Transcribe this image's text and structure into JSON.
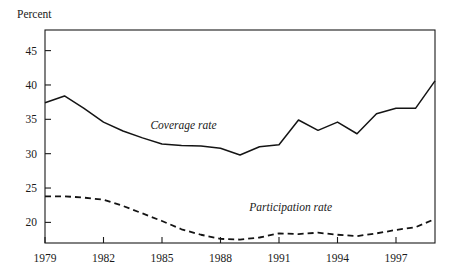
{
  "chart_data": {
    "type": "line",
    "title": "",
    "ylabel": "Percent",
    "xlabel": "",
    "grid": false,
    "legend_position": "inline-annotation",
    "xlim": [
      1979,
      1999
    ],
    "ylim": [
      17,
      48
    ],
    "x_ticks": [
      1979,
      1982,
      1985,
      1988,
      1991,
      1994,
      1997
    ],
    "x_tick_labels": [
      "1979",
      "1982",
      "1985",
      "1988",
      "1991",
      "1994",
      "1997"
    ],
    "y_ticks": [
      20,
      25,
      30,
      35,
      40,
      45
    ],
    "y_tick_labels": [
      "20",
      "25",
      "30",
      "35",
      "40",
      "45"
    ],
    "x": [
      1979,
      1980,
      1981,
      1982,
      1983,
      1984,
      1985,
      1986,
      1987,
      1988,
      1989,
      1990,
      1991,
      1992,
      1993,
      1994,
      1995,
      1996,
      1997,
      1998,
      1999
    ],
    "series": [
      {
        "name": "Coverage rate",
        "style": "solid",
        "color": "#141414",
        "label_x": 1986.1,
        "label_y": 33.6,
        "values": [
          37.4,
          38.4,
          36.6,
          34.6,
          33.3,
          32.3,
          31.4,
          31.2,
          31.1,
          30.8,
          29.8,
          31.0,
          31.3,
          34.9,
          33.4,
          34.6,
          32.9,
          35.8,
          36.6,
          36.6,
          40.6
        ]
      },
      {
        "name": "Participation rate",
        "style": "dashed",
        "color": "#141414",
        "label_x": 1991.6,
        "label_y": 21.7,
        "values": [
          23.8,
          23.8,
          23.6,
          23.3,
          22.4,
          21.3,
          20.2,
          19.0,
          18.2,
          17.6,
          17.5,
          17.8,
          18.4,
          18.3,
          18.5,
          18.2,
          18.0,
          18.4,
          18.9,
          19.3,
          20.5
        ]
      }
    ]
  },
  "axis": {
    "percent_label": "Percent"
  }
}
